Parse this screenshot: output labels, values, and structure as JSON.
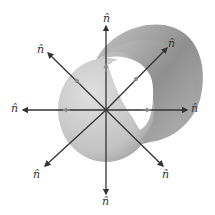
{
  "diagram": {
    "normal_label": "n̂",
    "labels": [
      {
        "id": "top",
        "text": "n̂",
        "x": 103,
        "y": 13
      },
      {
        "id": "upper-left",
        "text": "n̂",
        "x": 37,
        "y": 44
      },
      {
        "id": "upper-right",
        "text": "n̂",
        "x": 168,
        "y": 38
      },
      {
        "id": "left",
        "text": "n̂",
        "x": 11,
        "y": 103
      },
      {
        "id": "right",
        "text": "n̂",
        "x": 191,
        "y": 103
      },
      {
        "id": "lower-left",
        "text": "n̂",
        "x": 33,
        "y": 169
      },
      {
        "id": "lower-right",
        "text": "n̂",
        "x": 162,
        "y": 169
      },
      {
        "id": "bottom",
        "text": "n̂",
        "x": 102,
        "y": 196
      }
    ],
    "colors": {
      "arrow": "#3a3a3a",
      "tube_light": "#d9d9d9",
      "tube_dark": "#9a9a9a",
      "hole": "#ffffff"
    }
  }
}
